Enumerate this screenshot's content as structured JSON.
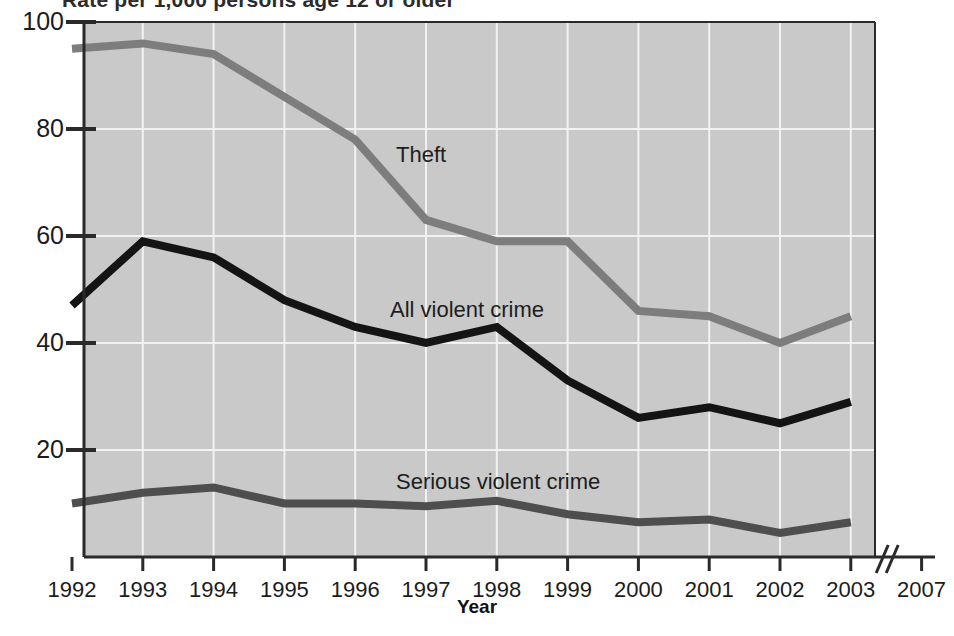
{
  "figure": {
    "clipped_heading": "Rate per 1,000 persons age 12 or older",
    "xlabel": "Year",
    "ylabel": ""
  },
  "axes": {
    "y_ticks": [
      "100",
      "80",
      "60",
      "40",
      "20"
    ],
    "y_tick_values": [
      100,
      80,
      60,
      40,
      20
    ],
    "x_ticks": [
      "1992",
      "1993",
      "1994",
      "1995",
      "1996",
      "1997",
      "1998",
      "1999",
      "2000",
      "2001",
      "2002",
      "2003",
      "2007"
    ],
    "axis_break_glyph": "//"
  },
  "series_labels": {
    "theft": "Theft",
    "all_violent": "All violent crime",
    "serious_violent": "Serious violent crime"
  },
  "colors": {
    "plot_background": "#c9c9c9",
    "gridline": "#f2f2f2",
    "axis": "#2a2a2a",
    "theft_line": "#7d7d7d",
    "all_violent_line": "#141414",
    "serious_violent_line": "#4e4e4e",
    "text": "#1c1c1c"
  },
  "chart_data": {
    "type": "line",
    "title": "",
    "xlabel": "Year",
    "ylabel": "Rate per 1,000 persons age 12 or older",
    "x": [
      1992,
      1993,
      1994,
      1995,
      1996,
      1997,
      1998,
      1999,
      2000,
      2001,
      2002,
      2003
    ],
    "categories": [
      "1992",
      "1993",
      "1994",
      "1995",
      "1996",
      "1997",
      "1998",
      "1999",
      "2000",
      "2001",
      "2002",
      "2003"
    ],
    "xlim": [
      1992,
      2007
    ],
    "ylim": [
      0,
      100
    ],
    "grid": true,
    "legend": "inline-labels",
    "axis_break": {
      "after": 2003,
      "before": 2007,
      "glyph": "//"
    },
    "series": [
      {
        "name": "Theft",
        "color": "#7d7d7d",
        "values": [
          95,
          96,
          94,
          86,
          78,
          63,
          59,
          59,
          46,
          45,
          40,
          45
        ]
      },
      {
        "name": "All violent crime",
        "color": "#141414",
        "values": [
          47,
          59,
          56,
          48,
          43,
          40,
          43,
          33,
          26,
          28,
          25,
          29
        ]
      },
      {
        "name": "Serious violent crime",
        "color": "#4e4e4e",
        "values": [
          10,
          12,
          13,
          10,
          10,
          9.5,
          10.5,
          8,
          6.5,
          7,
          4.5,
          6.5
        ]
      }
    ]
  }
}
